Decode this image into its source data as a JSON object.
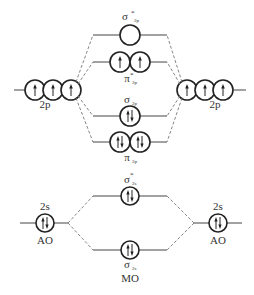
{
  "diagram": {
    "type": "molecular-orbital-diagram",
    "colors": {
      "line": "#444444",
      "dashed": "#777777",
      "orbital": "#222222",
      "text": "#333333"
    },
    "atomic_orbitals": {
      "left_2p": {
        "label": "2p",
        "electrons": [
          "up",
          "up",
          "up"
        ]
      },
      "right_2p": {
        "label": "2p",
        "electrons": [
          "up",
          "up",
          "up"
        ]
      },
      "left_2s": {
        "label": "2s",
        "sublabel": "AO",
        "electrons": [
          "pair"
        ]
      },
      "right_2s": {
        "label": "2s",
        "sublabel": "AO",
        "electrons": [
          "pair"
        ]
      }
    },
    "molecular_orbitals": [
      {
        "id": "sigma_star_2p",
        "symbol": "σ",
        "star": "*",
        "subscript": "2p",
        "electrons": [
          "empty"
        ]
      },
      {
        "id": "pi_star_2p",
        "symbol": "π",
        "star": "*",
        "subscript": "2p",
        "electrons": [
          "up",
          "up"
        ]
      },
      {
        "id": "sigma_2p",
        "symbol": "σ",
        "star": "",
        "subscript": "2p",
        "electrons": [
          "pair"
        ]
      },
      {
        "id": "pi_2p",
        "symbol": "π",
        "star": "",
        "subscript": "2p",
        "electrons": [
          "pair",
          "pair"
        ]
      },
      {
        "id": "sigma_star_2s",
        "symbol": "σ",
        "star": "*",
        "subscript": "2s",
        "electrons": [
          "pair"
        ]
      },
      {
        "id": "sigma_2s",
        "symbol": "σ",
        "star": "",
        "subscript": "2s",
        "electrons": [
          "pair"
        ],
        "caption": "MO"
      }
    ]
  }
}
